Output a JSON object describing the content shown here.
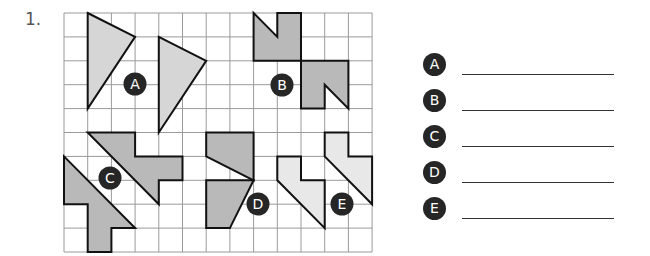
{
  "question": {
    "number": "1."
  },
  "grid": {
    "origin_x": 64,
    "origin_y": 13,
    "cols": 13,
    "rows": 10,
    "cell_w": 23.7,
    "cell_h": 23.9,
    "line_color": "#9a9a9a",
    "outline_color": "#111111"
  },
  "colors": {
    "fill_light": "#d6d6d6",
    "fill_dark": "#b9b9b9",
    "fill_pale": "#e8e8e8",
    "badge": "#262626",
    "badge_text": "#ffffff",
    "answer_line": "#333333"
  },
  "shape_pairs": [
    {
      "label": "A",
      "badge_pos": [
        135,
        84
      ],
      "fill": "#d6d6d6",
      "shapes": [
        [
          [
            1,
            0
          ],
          [
            3,
            1
          ],
          [
            1,
            4
          ]
        ],
        [
          [
            4,
            1
          ],
          [
            6,
            2
          ],
          [
            4,
            5
          ]
        ]
      ]
    },
    {
      "label": "B",
      "badge_pos": [
        282,
        85
      ],
      "fill": "#b9b9b9",
      "shapes": [
        [
          [
            8,
            0
          ],
          [
            9,
            1
          ],
          [
            9,
            0
          ],
          [
            10,
            0
          ],
          [
            10,
            2
          ],
          [
            8,
            2
          ]
        ],
        [
          [
            10,
            2
          ],
          [
            12,
            2
          ],
          [
            12,
            4
          ],
          [
            11,
            3
          ],
          [
            11,
            4
          ],
          [
            10,
            4
          ]
        ]
      ]
    },
    {
      "label": "C",
      "badge_pos": [
        110,
        178
      ],
      "fill": "#b9b9b9",
      "shapes": [
        [
          [
            1,
            5
          ],
          [
            3,
            5
          ],
          [
            3,
            6
          ],
          [
            5,
            6
          ],
          [
            5,
            7
          ],
          [
            4,
            7
          ],
          [
            4,
            8
          ]
        ],
        [
          [
            0,
            6
          ],
          [
            3,
            9
          ],
          [
            2,
            9
          ],
          [
            2,
            10
          ],
          [
            1,
            10
          ],
          [
            1,
            8
          ],
          [
            0,
            8
          ]
        ]
      ]
    },
    {
      "label": "D",
      "badge_pos": [
        258,
        204
      ],
      "fill": "#b9b9b9",
      "shapes": [
        [
          [
            6,
            5
          ],
          [
            8,
            5
          ],
          [
            8,
            7
          ],
          [
            6,
            6
          ]
        ],
        [
          [
            6,
            7
          ],
          [
            8,
            7
          ],
          [
            7,
            9
          ],
          [
            6,
            9
          ]
        ]
      ]
    },
    {
      "label": "E",
      "badge_pos": [
        342,
        204
      ],
      "fill": "#e8e8e8",
      "shapes": [
        [
          [
            9,
            6
          ],
          [
            10,
            6
          ],
          [
            10,
            7
          ],
          [
            11,
            7
          ],
          [
            11,
            9
          ],
          [
            9,
            7
          ]
        ],
        [
          [
            11,
            5
          ],
          [
            12,
            5
          ],
          [
            12,
            6
          ],
          [
            13,
            6
          ],
          [
            13,
            8
          ],
          [
            11,
            6
          ]
        ]
      ]
    }
  ],
  "answers": [
    {
      "label": "A",
      "value": "",
      "top": 53
    },
    {
      "label": "B",
      "value": "",
      "top": 89
    },
    {
      "label": "C",
      "value": "",
      "top": 125
    },
    {
      "label": "D",
      "value": "",
      "top": 161
    },
    {
      "label": "E",
      "value": "",
      "top": 197
    }
  ]
}
